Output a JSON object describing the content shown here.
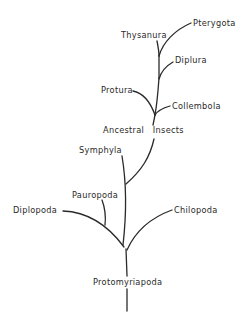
{
  "diagram": {
    "type": "phylogenetic-tree",
    "colors": {
      "line": "#2a2a2a",
      "background": "#ffffff"
    },
    "labels": {
      "pterygota": "Pterygota",
      "thysanura": "Thysanura",
      "diplura": "Diplura",
      "protura": "Protura",
      "collembola": "Collembola",
      "ancestral_insects": "Ancestral   Insects",
      "symphyla": "Symphyla",
      "pauropoda": "Pauropoda",
      "diplopoda": "Diplopoda",
      "chilopoda": "Chilopoda",
      "protomyriapoda": "Protomyriapoda"
    },
    "nodes": [
      {
        "id": "protomyriapoda",
        "children": [
          "diplopoda-pauropoda",
          "symphyla-insects",
          "chilopoda"
        ]
      },
      {
        "id": "ancestral-insects",
        "children": [
          "protura",
          "collembola",
          "diplura-thysanura-pterygota"
        ]
      },
      {
        "id": "thysanura-pterygota",
        "children": [
          "thysanura",
          "pterygota"
        ]
      }
    ]
  }
}
